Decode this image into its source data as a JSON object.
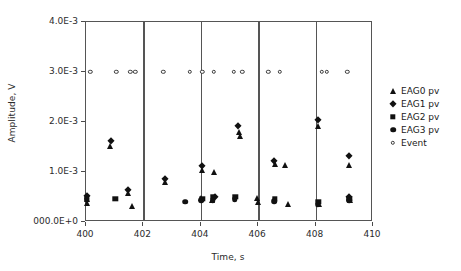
{
  "chart_data": {
    "type": "scatter",
    "title": "",
    "xlabel": "Time, s",
    "ylabel": "Amplitude, V",
    "xlim": [
      400,
      410
    ],
    "ylim": [
      0,
      0.004
    ],
    "xticks": [
      400,
      402,
      404,
      406,
      408,
      410
    ],
    "xtick_labels": [
      "400",
      "402",
      "404",
      "406",
      "408",
      "410"
    ],
    "yticks": [
      0,
      0.001,
      0.002,
      0.003,
      0.004
    ],
    "ytick_labels": [
      "000.0E+0",
      "1.0E-3",
      "2.0E-3",
      "3.0E-3",
      "4.0E-3"
    ],
    "grid": "vertical-at-xticks",
    "legend_position": "right",
    "series": [
      {
        "name": "EAG0 pv",
        "marker": "triangle",
        "color": "#111111",
        "points": [
          {
            "x": 400.02,
            "y": 0.00046
          },
          {
            "x": 400.05,
            "y": 0.00039
          },
          {
            "x": 400.85,
            "y": 0.00152
          },
          {
            "x": 401.45,
            "y": 0.00058
          },
          {
            "x": 401.62,
            "y": 0.00032
          },
          {
            "x": 402.75,
            "y": 0.00081
          },
          {
            "x": 404.02,
            "y": 0.00048
          },
          {
            "x": 404.05,
            "y": 0.00105
          },
          {
            "x": 404.38,
            "y": 0.00044
          },
          {
            "x": 404.45,
            "y": 0.001
          },
          {
            "x": 405.32,
            "y": 0.0018
          },
          {
            "x": 405.35,
            "y": 0.00172
          },
          {
            "x": 405.95,
            "y": 0.00048
          },
          {
            "x": 405.98,
            "y": 0.0004
          },
          {
            "x": 406.6,
            "y": 0.00117
          },
          {
            "x": 406.95,
            "y": 0.00115
          },
          {
            "x": 407.05,
            "y": 0.00036
          },
          {
            "x": 408.1,
            "y": 0.00192
          },
          {
            "x": 408.12,
            "y": 0.00037
          },
          {
            "x": 409.15,
            "y": 0.00114
          },
          {
            "x": 409.2,
            "y": 0.00045
          }
        ]
      },
      {
        "name": "EAG1 pv",
        "marker": "diamond",
        "color": "#111111",
        "points": [
          {
            "x": 400.02,
            "y": 0.00052
          },
          {
            "x": 400.88,
            "y": 0.00162
          },
          {
            "x": 401.45,
            "y": 0.00064
          },
          {
            "x": 402.75,
            "y": 0.00086
          },
          {
            "x": 404.05,
            "y": 0.00113
          },
          {
            "x": 404.48,
            "y": 0.00051
          },
          {
            "x": 405.3,
            "y": 0.00192
          },
          {
            "x": 406.55,
            "y": 0.00122
          },
          {
            "x": 408.1,
            "y": 0.00205
          },
          {
            "x": 409.15,
            "y": 0.00132
          },
          {
            "x": 409.18,
            "y": 0.00051
          }
        ]
      },
      {
        "name": "EAG2 pv",
        "marker": "square",
        "color": "#111111",
        "points": [
          {
            "x": 400.02,
            "y": 0.00046
          },
          {
            "x": 401.02,
            "y": 0.00047
          },
          {
            "x": 404.05,
            "y": 0.00046
          },
          {
            "x": 404.42,
            "y": 0.0005
          },
          {
            "x": 405.2,
            "y": 0.0005
          },
          {
            "x": 406.58,
            "y": 0.00046
          },
          {
            "x": 408.1,
            "y": 0.0004
          },
          {
            "x": 409.18,
            "y": 0.00047
          }
        ]
      },
      {
        "name": "EAG3 pv",
        "marker": "circle",
        "color": "#111111",
        "points": [
          {
            "x": 400.02,
            "y": 0.00047
          },
          {
            "x": 403.45,
            "y": 0.00041
          },
          {
            "x": 404.02,
            "y": 0.00044
          },
          {
            "x": 404.42,
            "y": 0.00044
          },
          {
            "x": 405.18,
            "y": 0.00046
          },
          {
            "x": 406.55,
            "y": 0.00042
          },
          {
            "x": 408.08,
            "y": 0.00035
          },
          {
            "x": 409.18,
            "y": 0.00044
          }
        ]
      },
      {
        "name": "Event",
        "marker": "open-circle",
        "color": "#3a3a3a",
        "points": [
          {
            "x": 400.15,
            "y": 0.003
          },
          {
            "x": 401.05,
            "y": 0.003
          },
          {
            "x": 401.55,
            "y": 0.003
          },
          {
            "x": 401.72,
            "y": 0.003
          },
          {
            "x": 402.7,
            "y": 0.003
          },
          {
            "x": 403.62,
            "y": 0.003
          },
          {
            "x": 404.05,
            "y": 0.003
          },
          {
            "x": 404.45,
            "y": 0.003
          },
          {
            "x": 405.15,
            "y": 0.003
          },
          {
            "x": 405.45,
            "y": 0.003
          },
          {
            "x": 406.35,
            "y": 0.003
          },
          {
            "x": 406.75,
            "y": 0.003
          },
          {
            "x": 408.22,
            "y": 0.003
          },
          {
            "x": 408.4,
            "y": 0.003
          },
          {
            "x": 409.1,
            "y": 0.003
          }
        ]
      }
    ],
    "legend_entries": [
      {
        "label": "EAG0 pv",
        "marker": "triangle"
      },
      {
        "label": "EAG1 pv",
        "marker": "diamond"
      },
      {
        "label": "EAG2 pv",
        "marker": "square"
      },
      {
        "label": "EAG3 pv",
        "marker": "circle"
      },
      {
        "label": "Event",
        "marker": "open-circle"
      }
    ]
  }
}
